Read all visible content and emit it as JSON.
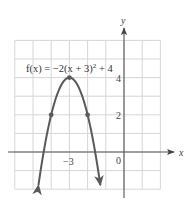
{
  "chart_data": {
    "type": "line",
    "function": "f(x) = -2(x+3)^2 + 4",
    "xlabel": "x",
    "ylabel": "y",
    "xlim": [
      -6,
      2
    ],
    "ylim": [
      -2,
      6
    ],
    "grid": true,
    "tick_labels": {
      "x": [
        {
          "value": -3,
          "label": "−3"
        },
        {
          "value": 0,
          "label": "0"
        }
      ],
      "y": [
        {
          "value": 2,
          "label": "2"
        },
        {
          "value": 4,
          "label": "4"
        }
      ]
    },
    "series": [
      {
        "name": "f(x) = −2(x + 3)² + 4",
        "x": [
          -4.7,
          -4.5,
          -4,
          -3.5,
          -3,
          -2.5,
          -2,
          -1.5,
          -1.3
        ],
        "y": [
          -1.78,
          -0.5,
          2,
          3.5,
          4,
          3.5,
          2,
          -0.5,
          -1.78
        ],
        "arrows_at_ends": true
      }
    ],
    "highlighted_points": [
      {
        "x": -4,
        "y": 2
      },
      {
        "x": -3,
        "y": 4,
        "label": "vertex"
      },
      {
        "x": -2,
        "y": 2
      }
    ]
  },
  "labels": {
    "equation_prefix": "f(x) = −2(x + 3)",
    "equation_exp": "2",
    "equation_suffix": " + 4",
    "x_axis": "x",
    "y_axis": "y",
    "tick_x_neg3": "−3",
    "tick_x_0": "0",
    "tick_y_2": "2",
    "tick_y_4": "4"
  },
  "colors": {
    "curve": "#5a5a5a",
    "grid": "#d6d6d6",
    "axis": "#555555"
  }
}
